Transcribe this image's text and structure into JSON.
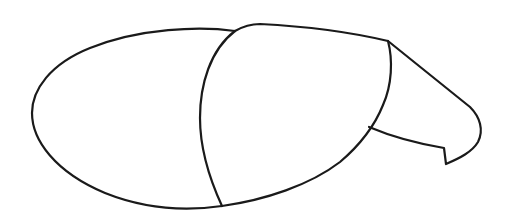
{
  "figure": {
    "stroke_color": "#1a1a1a",
    "background_color": "#ffffff",
    "sections": [
      {
        "name": "left-segment",
        "label": ""
      },
      {
        "name": "middle-segment",
        "label": ""
      },
      {
        "name": "right-segment",
        "label": ""
      }
    ]
  }
}
